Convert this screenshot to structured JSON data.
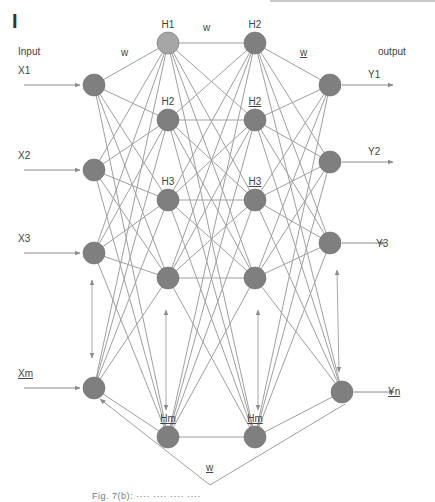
{
  "panel_label": "I",
  "colors": {
    "node_fill": "#7f7f7f",
    "node_top_fill": "#a6a6a6",
    "edge": "#a0a0a0",
    "arrow": "#8c8c8c",
    "text": "#444444"
  },
  "labels": {
    "input": "Input",
    "output": "output",
    "w_input_hidden": "w",
    "w_hidden_hidden": "w",
    "w_hidden_output": "w",
    "w_feedback": "w"
  },
  "input_layer": {
    "nodes": [
      {
        "label": "X1",
        "x": 94,
        "y": 85
      },
      {
        "label": "X2",
        "x": 94,
        "y": 170
      },
      {
        "label": "X3",
        "x": 94,
        "y": 253
      },
      {
        "label": "Xm",
        "x": 94,
        "y": 388
      }
    ]
  },
  "hidden_layer_1": {
    "nodes": [
      {
        "label": "H1",
        "x": 168,
        "y": 43
      },
      {
        "label": "H2",
        "x": 168,
        "y": 120
      },
      {
        "label": "H3",
        "x": 168,
        "y": 200
      },
      {
        "label": "",
        "x": 168,
        "y": 278
      },
      {
        "label": "Hm",
        "x": 168,
        "y": 437
      }
    ]
  },
  "hidden_layer_2": {
    "nodes": [
      {
        "label": "H2",
        "x": 255,
        "y": 43
      },
      {
        "label": "H2",
        "x": 255,
        "y": 120
      },
      {
        "label": "H3",
        "x": 255,
        "y": 200
      },
      {
        "label": "",
        "x": 255,
        "y": 278
      },
      {
        "label": "Hm",
        "x": 255,
        "y": 437
      }
    ]
  },
  "output_layer": {
    "nodes": [
      {
        "label": "Y1",
        "x": 330,
        "y": 85
      },
      {
        "label": "Y2",
        "x": 330,
        "y": 162
      },
      {
        "label": "Y3",
        "x": 330,
        "y": 243
      },
      {
        "label": "Yn",
        "x": 342,
        "y": 392
      }
    ]
  },
  "caption": "Fig. 7(b): ···· ···· ···· ····"
}
